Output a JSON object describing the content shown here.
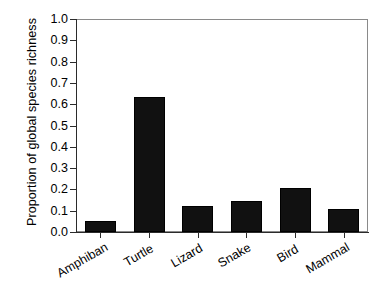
{
  "chart_data": {
    "type": "bar",
    "title": "",
    "subtitle": "",
    "xlabel": "",
    "ylabel": "Proportion of global species richness",
    "categories": [
      "Amphiban",
      "Turtle",
      "Lizard",
      "Snake",
      "Bird",
      "Mammal"
    ],
    "values": [
      0.05,
      0.635,
      0.12,
      0.147,
      0.207,
      0.11
    ],
    "series": [
      {
        "name": "Proportion of global species richness",
        "values": [
          0.05,
          0.635,
          0.12,
          0.147,
          0.207,
          0.11
        ]
      }
    ],
    "ylim": [
      0.0,
      1.0
    ],
    "ytick_labels": [
      "0.0",
      "0.1",
      "0.2",
      "0.3",
      "0.4",
      "0.5",
      "0.6",
      "0.7",
      "0.8",
      "0.9",
      "1.0"
    ],
    "ytick_values": [
      0.0,
      0.1,
      0.2,
      0.3,
      0.4,
      0.5,
      0.6,
      0.7,
      0.8,
      0.9,
      1.0
    ],
    "grid": false,
    "legend": false,
    "legend_position": "none",
    "bar_color": "#111111",
    "axis_color": "#2b2b2b",
    "frame_color": "#8a8a8a",
    "background_color": "#ffffff",
    "annotations": []
  },
  "axis": {
    "y_title": "Proportion of global species richness"
  }
}
